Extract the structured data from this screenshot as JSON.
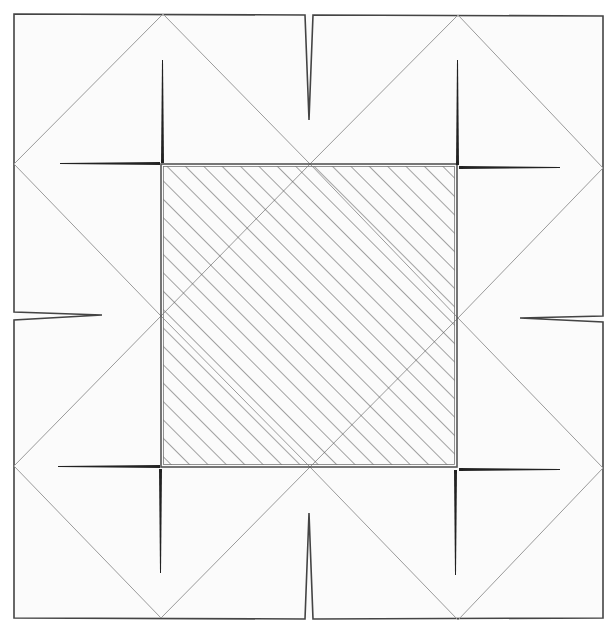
{
  "diagram": {
    "type": "fold-diagram",
    "colors": {
      "background": "#fbfbfb",
      "outline": "#444444",
      "fold_line": "#9a9a9a",
      "hatch": "#555555",
      "cut": "#222222"
    },
    "outer_square": {
      "x1": 14,
      "y1": 14,
      "x2": 603,
      "y2": 618
    },
    "center_square": {
      "x1": 161,
      "y1": 164,
      "x2": 457,
      "y2": 467,
      "fill": "diagonal-hatch"
    },
    "diamonds": [
      {
        "name": "top-left",
        "points": [
          [
            161,
            14
          ],
          [
            310,
            164
          ],
          [
            161,
            316
          ],
          [
            14,
            164
          ]
        ]
      },
      {
        "name": "top-right",
        "points": [
          [
            458,
            14
          ],
          [
            603,
            166
          ],
          [
            458,
            318
          ],
          [
            310,
            164
          ]
        ]
      },
      {
        "name": "bottom-left",
        "points": [
          [
            161,
            316
          ],
          [
            310,
            467
          ],
          [
            161,
            618
          ],
          [
            14,
            466
          ]
        ]
      },
      {
        "name": "bottom-right",
        "points": [
          [
            458,
            318
          ],
          [
            603,
            468
          ],
          [
            458,
            620
          ],
          [
            310,
            467
          ]
        ]
      }
    ],
    "notches": [
      {
        "name": "top-notch",
        "side": "top",
        "at": 310,
        "depth": 120
      },
      {
        "name": "bottom-notch",
        "side": "bottom",
        "at": 309,
        "depth": 105
      },
      {
        "name": "left-notch",
        "side": "left",
        "at": 316,
        "depth": 88
      },
      {
        "name": "right-notch",
        "side": "right",
        "at": 318,
        "depth": 85
      }
    ],
    "slits": [
      {
        "name": "slit-tl-vertical",
        "x1": 163,
        "y1": 60,
        "x2": 163,
        "y2": 164
      },
      {
        "name": "slit-tl-horizontal",
        "x1": 60,
        "y1": 164,
        "x2": 161,
        "y2": 164
      },
      {
        "name": "slit-tr-vertical",
        "x1": 458,
        "y1": 60,
        "x2": 458,
        "y2": 166
      },
      {
        "name": "slit-tr-horizontal",
        "x1": 458,
        "y1": 167,
        "x2": 560,
        "y2": 167
      },
      {
        "name": "slit-bl-vertical",
        "x1": 161,
        "y1": 468,
        "x2": 161,
        "y2": 573
      },
      {
        "name": "slit-bl-horizontal",
        "x1": 58,
        "y1": 466,
        "x2": 161,
        "y2": 466
      },
      {
        "name": "slit-br-vertical",
        "x1": 456,
        "y1": 470,
        "x2": 456,
        "y2": 575
      },
      {
        "name": "slit-br-horizontal",
        "x1": 457,
        "y1": 469,
        "x2": 560,
        "y2": 469
      }
    ]
  }
}
